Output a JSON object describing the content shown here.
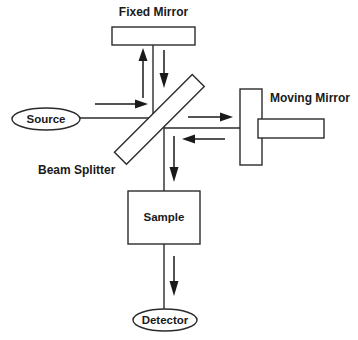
{
  "diagram": {
    "colors": {
      "stroke": "#2b2b2b",
      "text": "#1a1a1a",
      "background": "#ffffff",
      "shape_fill": "#ffffff"
    },
    "labels": {
      "fixed_mirror": "Fixed Mirror",
      "moving_mirror": "Moving Mirror",
      "beam_splitter": "Beam Splitter",
      "source": "Source",
      "sample": "Sample",
      "detector": "Detector"
    },
    "components": [
      {
        "name": "fixed-mirror",
        "shape": "rectangle",
        "label": "Fixed Mirror"
      },
      {
        "name": "beam-splitter",
        "shape": "rotated-rectangle",
        "label": "Beam Splitter"
      },
      {
        "name": "moving-mirror",
        "shape": "rectangle-with-shaft",
        "label": "Moving Mirror"
      },
      {
        "name": "source",
        "shape": "ellipse",
        "label": "Source"
      },
      {
        "name": "sample",
        "shape": "rectangle",
        "label": "Sample"
      },
      {
        "name": "detector",
        "shape": "ellipse",
        "label": "Detector"
      }
    ],
    "beam_paths": [
      {
        "name": "source-to-splitter",
        "direction": "right"
      },
      {
        "name": "splitter-to-fixed-mirror",
        "direction": "up"
      },
      {
        "name": "fixed-mirror-to-splitter",
        "direction": "down"
      },
      {
        "name": "splitter-to-moving-mirror",
        "direction": "right"
      },
      {
        "name": "moving-mirror-to-splitter",
        "direction": "left"
      },
      {
        "name": "splitter-to-sample",
        "direction": "down"
      },
      {
        "name": "sample-to-detector",
        "direction": "down"
      }
    ]
  }
}
